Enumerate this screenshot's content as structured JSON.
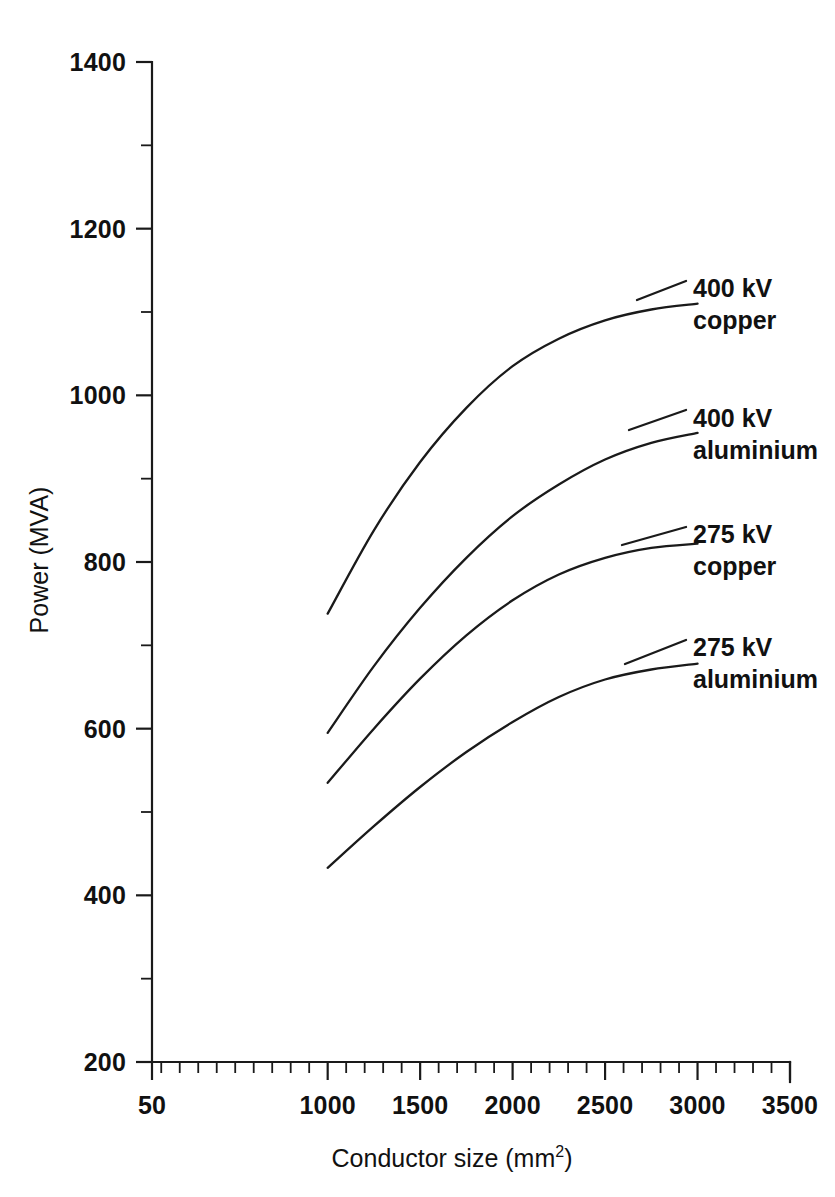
{
  "chart_data": {
    "type": "line",
    "title": "",
    "xlabel": "Conductor size (mm2)",
    "xlabel_main": "Conductor size (mm",
    "xlabel_sup": "2",
    "xlabel_tail": ")",
    "ylabel": "Power (MVA)",
    "xlim": [
      50,
      3500
    ],
    "ylim": [
      200,
      1400
    ],
    "grid": false,
    "legend_position": "inline-right-labels",
    "x_ticks": [
      50,
      1000,
      1500,
      2000,
      2500,
      3000,
      3500
    ],
    "x_tick_labels": [
      "50",
      "1000",
      "1500",
      "2000",
      "2500",
      "3000",
      "3500"
    ],
    "x_minor_step": 100,
    "y_ticks": [
      200,
      400,
      600,
      800,
      1000,
      1200,
      1400
    ],
    "y_tick_labels": [
      "200",
      "400",
      "600",
      "800",
      "1000",
      "1200",
      "1400"
    ],
    "y_minor_step": 100,
    "x": [
      1000,
      1250,
      1500,
      1750,
      2000,
      2250,
      2500,
      2750,
      3000
    ],
    "series": [
      {
        "name": "400 kV copper",
        "label_line1": "400 kV",
        "label_line2": "copper",
        "values": [
          738,
          838,
          920,
          985,
          1035,
          1068,
          1090,
          1103,
          1110
        ]
      },
      {
        "name": "400 kV aluminium",
        "label_line1": "400 kV",
        "label_line2": "aluminium",
        "values": [
          595,
          675,
          745,
          805,
          855,
          893,
          923,
          943,
          955
        ]
      },
      {
        "name": "275 kV copper",
        "label_line1": "275 kV",
        "label_line2": "copper",
        "values": [
          535,
          600,
          660,
          712,
          754,
          785,
          805,
          817,
          822
        ]
      },
      {
        "name": "275 kV aluminium",
        "label_line1": "275 kV",
        "label_line2": "aluminium",
        "values": [
          433,
          483,
          530,
          572,
          608,
          638,
          659,
          671,
          678
        ]
      }
    ],
    "colors": {
      "curve": "#1a1a1a",
      "axis": "#1a1a1a",
      "text": "#111111",
      "background": "#ffffff"
    }
  }
}
